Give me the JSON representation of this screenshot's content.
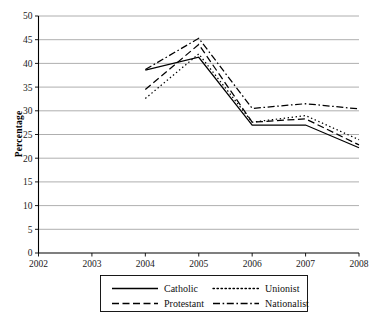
{
  "chart_data": {
    "type": "line",
    "title": "",
    "xlabel": "",
    "ylabel": "Percentage",
    "x": [
      2002,
      2003,
      2004,
      2005,
      2006,
      2007,
      2008
    ],
    "xtick_labels": [
      "2002",
      "2003",
      "2004",
      "2005",
      "2006",
      "2007",
      "2008"
    ],
    "xlim": [
      2002,
      2008
    ],
    "ylim": [
      0,
      50
    ],
    "ytick_labels": [
      "0",
      "5",
      "10",
      "15",
      "20",
      "25",
      "30",
      "35",
      "40",
      "45",
      "50"
    ],
    "ytick_values": [
      0,
      5,
      10,
      15,
      20,
      25,
      30,
      35,
      40,
      45,
      50
    ],
    "grid": true,
    "legend_position": "bottom",
    "series": [
      {
        "name": "Catholic",
        "style": "solid",
        "x": [
          2004,
          2005,
          2006,
          2007,
          2008
        ],
        "values": [
          38.6,
          41.3,
          27.0,
          27.0,
          22.2
        ]
      },
      {
        "name": "Protestant",
        "style": "dashed",
        "x": [
          2004,
          2005,
          2006,
          2007,
          2008
        ],
        "values": [
          34.5,
          44.0,
          27.6,
          28.3,
          22.8
        ]
      },
      {
        "name": "Unionist",
        "style": "dotted",
        "x": [
          2004,
          2005,
          2006,
          2007,
          2008
        ],
        "values": [
          32.6,
          42.0,
          27.6,
          29.0,
          23.9
        ]
      },
      {
        "name": "Nationalist",
        "style": "dashdot",
        "x": [
          2004,
          2005,
          2006,
          2007,
          2008
        ],
        "values": [
          38.7,
          45.3,
          30.5,
          31.5,
          30.4
        ]
      }
    ],
    "legend_entries": [
      {
        "label": "Catholic",
        "style": "solid"
      },
      {
        "label": "Unionist",
        "style": "dotted"
      },
      {
        "label": "Protestant",
        "style": "dashed"
      },
      {
        "label": "Nationalist",
        "style": "dashdot"
      }
    ],
    "colors": {
      "series": "#000000",
      "grid": "#9a9a9a",
      "axis": "#000000",
      "background": "#ffffff"
    }
  }
}
